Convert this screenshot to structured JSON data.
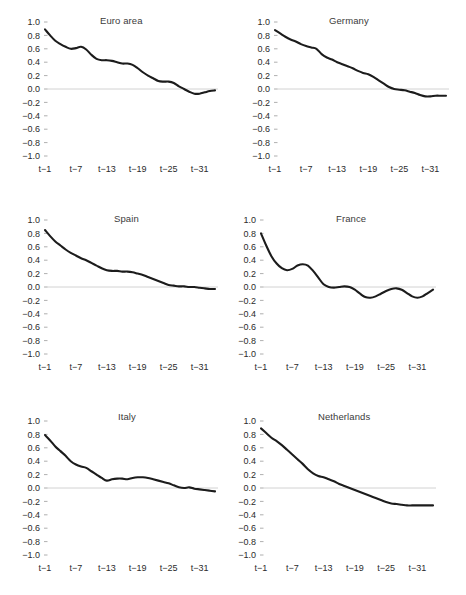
{
  "figure": {
    "panel_layout": "2 columns x 3 rows",
    "y_axis": {
      "labels": [
        "1.0",
        "0.8",
        "0.6",
        "0.4",
        "0.2",
        "0.0",
        "−0.2",
        "−0.4",
        "−0.6",
        "−0.8",
        "−1.0"
      ],
      "values": [
        1.0,
        0.8,
        0.6,
        0.4,
        0.2,
        0.0,
        -0.2,
        -0.4,
        -0.6,
        -0.8,
        -1.0
      ],
      "limits": [
        -1.0,
        1.0
      ]
    },
    "x_axis": {
      "labels": [
        "t−1",
        "t−7",
        "t−13",
        "t−19",
        "t−25",
        "t−31"
      ],
      "values": [
        1,
        7,
        13,
        19,
        25,
        31
      ],
      "limits": [
        1,
        34
      ]
    },
    "colors": {
      "line": "#1c1c1c",
      "zero_line": "#d2d2d2",
      "tick": "#9a9a9a",
      "text": "#2b2b2b",
      "background": "#ffffff"
    }
  },
  "chart_data": [
    {
      "type": "line",
      "title": "Euro area",
      "xlabel": "",
      "ylabel": "",
      "xlim": [
        1,
        34
      ],
      "ylim": [
        -1.0,
        1.0
      ],
      "grid": false,
      "legend": "none",
      "x": [
        1,
        2,
        3,
        4,
        5,
        6,
        7,
        8,
        9,
        10,
        11,
        12,
        13,
        14,
        15,
        16,
        17,
        18,
        19,
        20,
        21,
        22,
        23,
        24,
        25,
        26,
        27,
        28,
        29,
        30,
        31,
        32,
        33,
        34
      ],
      "values": [
        0.89,
        0.8,
        0.72,
        0.67,
        0.63,
        0.6,
        0.61,
        0.63,
        0.59,
        0.51,
        0.45,
        0.43,
        0.43,
        0.42,
        0.4,
        0.38,
        0.38,
        0.36,
        0.31,
        0.25,
        0.2,
        0.16,
        0.12,
        0.11,
        0.11,
        0.09,
        0.04,
        0.0,
        -0.04,
        -0.07,
        -0.07,
        -0.05,
        -0.03,
        -0.02
      ]
    },
    {
      "type": "line",
      "title": "Germany",
      "xlabel": "",
      "ylabel": "",
      "xlim": [
        1,
        34
      ],
      "ylim": [
        -1.0,
        1.0
      ],
      "grid": false,
      "legend": "none",
      "x": [
        1,
        2,
        3,
        4,
        5,
        6,
        7,
        8,
        9,
        10,
        11,
        12,
        13,
        14,
        15,
        16,
        17,
        18,
        19,
        20,
        21,
        22,
        23,
        24,
        25,
        26,
        27,
        28,
        29,
        30,
        31,
        32,
        33,
        34
      ],
      "values": [
        0.88,
        0.83,
        0.78,
        0.74,
        0.71,
        0.67,
        0.64,
        0.62,
        0.6,
        0.52,
        0.47,
        0.44,
        0.4,
        0.37,
        0.34,
        0.31,
        0.27,
        0.24,
        0.22,
        0.18,
        0.13,
        0.08,
        0.03,
        0.0,
        -0.01,
        -0.02,
        -0.04,
        -0.06,
        -0.09,
        -0.11,
        -0.11,
        -0.1,
        -0.1,
        -0.1
      ]
    },
    {
      "type": "line",
      "title": "Spain",
      "xlabel": "",
      "ylabel": "",
      "xlim": [
        1,
        34
      ],
      "ylim": [
        -1.0,
        1.0
      ],
      "grid": false,
      "legend": "none",
      "x": [
        1,
        2,
        3,
        4,
        5,
        6,
        7,
        8,
        9,
        10,
        11,
        12,
        13,
        14,
        15,
        16,
        17,
        18,
        19,
        20,
        21,
        22,
        23,
        24,
        25,
        26,
        27,
        28,
        29,
        30,
        31,
        32,
        33,
        34
      ],
      "values": [
        0.85,
        0.76,
        0.68,
        0.62,
        0.56,
        0.51,
        0.47,
        0.43,
        0.4,
        0.36,
        0.32,
        0.28,
        0.25,
        0.24,
        0.24,
        0.23,
        0.23,
        0.22,
        0.2,
        0.18,
        0.15,
        0.12,
        0.09,
        0.06,
        0.03,
        0.02,
        0.01,
        0.01,
        0.0,
        0.0,
        -0.01,
        -0.02,
        -0.03,
        -0.03
      ]
    },
    {
      "type": "line",
      "title": "France",
      "xlabel": "",
      "ylabel": "",
      "xlim": [
        1,
        34
      ],
      "ylim": [
        -1.0,
        1.0
      ],
      "grid": false,
      "legend": "none",
      "x": [
        1,
        2,
        3,
        4,
        5,
        6,
        7,
        8,
        9,
        10,
        11,
        12,
        13,
        14,
        15,
        16,
        17,
        18,
        19,
        20,
        21,
        22,
        23,
        24,
        25,
        26,
        27,
        28,
        29,
        30,
        31,
        32,
        33,
        34
      ],
      "values": [
        0.8,
        0.62,
        0.46,
        0.35,
        0.28,
        0.25,
        0.27,
        0.32,
        0.34,
        0.32,
        0.24,
        0.14,
        0.04,
        0.0,
        -0.01,
        0.0,
        0.01,
        0.0,
        -0.04,
        -0.1,
        -0.15,
        -0.16,
        -0.14,
        -0.1,
        -0.06,
        -0.03,
        -0.02,
        -0.04,
        -0.09,
        -0.14,
        -0.16,
        -0.14,
        -0.09,
        -0.04
      ]
    },
    {
      "type": "line",
      "title": "Italy",
      "xlabel": "",
      "ylabel": "",
      "xlim": [
        1,
        34
      ],
      "ylim": [
        -1.0,
        1.0
      ],
      "grid": false,
      "legend": "none",
      "x": [
        1,
        2,
        3,
        4,
        5,
        6,
        7,
        8,
        9,
        10,
        11,
        12,
        13,
        14,
        15,
        16,
        17,
        18,
        19,
        20,
        21,
        22,
        23,
        24,
        25,
        26,
        27,
        28,
        29,
        30,
        31,
        32,
        33,
        34
      ],
      "values": [
        0.79,
        0.71,
        0.62,
        0.55,
        0.48,
        0.4,
        0.35,
        0.32,
        0.3,
        0.25,
        0.2,
        0.15,
        0.11,
        0.13,
        0.14,
        0.14,
        0.13,
        0.15,
        0.16,
        0.16,
        0.15,
        0.13,
        0.11,
        0.09,
        0.07,
        0.04,
        0.01,
        0.0,
        0.01,
        -0.01,
        -0.02,
        -0.03,
        -0.04,
        -0.05
      ]
    },
    {
      "type": "line",
      "title": "Netherlands",
      "xlabel": "",
      "ylabel": "",
      "xlim": [
        1,
        34
      ],
      "ylim": [
        -1.0,
        1.0
      ],
      "grid": false,
      "legend": "none",
      "x": [
        1,
        2,
        3,
        4,
        5,
        6,
        7,
        8,
        9,
        10,
        11,
        12,
        13,
        14,
        15,
        16,
        17,
        18,
        19,
        20,
        21,
        22,
        23,
        24,
        25,
        26,
        27,
        28,
        29,
        30,
        31,
        32,
        33,
        34
      ],
      "values": [
        0.89,
        0.82,
        0.75,
        0.7,
        0.64,
        0.57,
        0.5,
        0.43,
        0.36,
        0.28,
        0.22,
        0.18,
        0.16,
        0.13,
        0.1,
        0.06,
        0.03,
        0.0,
        -0.03,
        -0.06,
        -0.09,
        -0.12,
        -0.15,
        -0.18,
        -0.21,
        -0.23,
        -0.24,
        -0.25,
        -0.26,
        -0.26,
        -0.26,
        -0.26,
        -0.26,
        -0.26
      ]
    }
  ]
}
